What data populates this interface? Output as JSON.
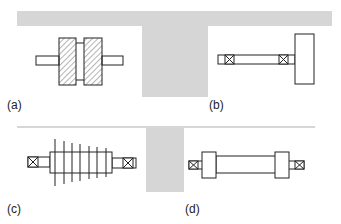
{
  "figure": {
    "panels": [
      {
        "id": "a",
        "label": "(a)",
        "description": "two hatched disks on a shaft"
      },
      {
        "id": "b",
        "label": "(b)",
        "description": "overhung rotor on shaft with two bearings"
      },
      {
        "id": "c",
        "label": "(c)",
        "description": "multi-stage bladed rotor between bearings"
      },
      {
        "id": "d",
        "label": "(d)",
        "description": "shaft with two end disks and bearings"
      }
    ],
    "colors": {
      "background": "#ffffff",
      "band": "#d6d6d6",
      "stroke": "#222222"
    }
  }
}
